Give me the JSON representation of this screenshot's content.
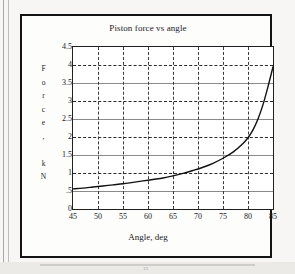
{
  "figure": {
    "page_marker": "13"
  },
  "chart_data": {
    "type": "line",
    "title": "Piston force vs angle",
    "xlabel": "Angle, deg",
    "ylabel": "Force, kN",
    "ylabel_letters": [
      "F",
      "o",
      "r",
      "c",
      "e",
      ",",
      "",
      "k",
      "N"
    ],
    "xlim": [
      45,
      85
    ],
    "ylim": [
      0,
      4.5
    ],
    "xticks": [
      45,
      50,
      55,
      60,
      65,
      70,
      75,
      80,
      85
    ],
    "xtick_labels": [
      "45",
      "50",
      "55",
      "60",
      "65",
      "70",
      "75",
      "80",
      "85"
    ],
    "yticks": [
      0,
      0.5,
      1,
      1.5,
      2,
      2.5,
      3,
      3.5,
      4,
      4.5
    ],
    "ytick_labels": [
      "0",
      ".5",
      "1",
      "1.5",
      "2",
      "2.5",
      "3",
      "3.5",
      "4",
      "4.5"
    ],
    "grid": true,
    "grid_style": "dashed",
    "legend": false,
    "series": [
      {
        "name": "Piston force",
        "color": "#111111",
        "x": [
          45,
          47,
          49,
          51,
          53,
          55,
          57,
          59,
          61,
          63,
          65,
          67,
          69,
          71,
          73,
          75,
          77,
          79,
          80,
          81,
          82,
          83,
          84,
          85
        ],
        "values": [
          0.56,
          0.58,
          0.61,
          0.64,
          0.67,
          0.7,
          0.74,
          0.78,
          0.82,
          0.86,
          0.92,
          0.99,
          1.07,
          1.16,
          1.27,
          1.41,
          1.58,
          1.82,
          1.98,
          2.2,
          2.5,
          2.9,
          3.4,
          3.95
        ]
      }
    ]
  }
}
